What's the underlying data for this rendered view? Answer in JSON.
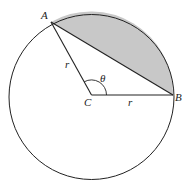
{
  "diagram": {
    "points": {
      "A": {
        "label": "A"
      },
      "B": {
        "label": "B"
      },
      "C": {
        "label": "C"
      }
    },
    "radius_label_1": "r",
    "radius_label_2": "r",
    "angle_label": "θ",
    "colors": {
      "stroke": "#222222",
      "segment_fill": "#c8c8c8",
      "background": "#ffffff"
    }
  }
}
